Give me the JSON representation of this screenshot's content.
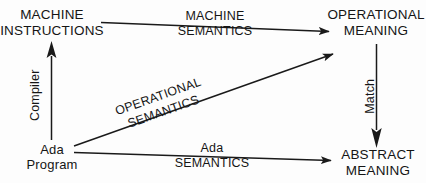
{
  "diagram": {
    "stroke_color": "#1a1a1a",
    "background_color": "#fdfdfd",
    "nodes": [
      {
        "id": "machine-instructions",
        "line1": "MACHINE",
        "line2": "INSTRUCTIONS"
      },
      {
        "id": "operational-meaning",
        "line1": "OPERATIONAL",
        "line2": "MEANING"
      },
      {
        "id": "ada-program",
        "line1": "Ada",
        "line2": "Program"
      },
      {
        "id": "abstract-meaning",
        "line1": "ABSTRACT",
        "line2": "MEANING"
      }
    ],
    "edges": [
      {
        "id": "machine-semantics",
        "from": "machine-instructions",
        "to": "operational-meaning",
        "line1": "MACHINE",
        "line2": "SEMANTICS",
        "direction": "right"
      },
      {
        "id": "compiler",
        "from": "ada-program",
        "to": "machine-instructions",
        "line1": "Compiler",
        "direction": "up"
      },
      {
        "id": "operational-semantics",
        "from": "ada-program",
        "to": "operational-meaning",
        "line1": "OPERATIONAL",
        "line2": "SEMANTICS",
        "direction": "up-right"
      },
      {
        "id": "match",
        "from": "operational-meaning",
        "to": "abstract-meaning",
        "line1": "Match",
        "direction": "down"
      },
      {
        "id": "ada-semantics",
        "from": "ada-program",
        "to": "abstract-meaning",
        "line1": "Ada",
        "line2": "SEMANTICS",
        "direction": "right"
      }
    ]
  }
}
